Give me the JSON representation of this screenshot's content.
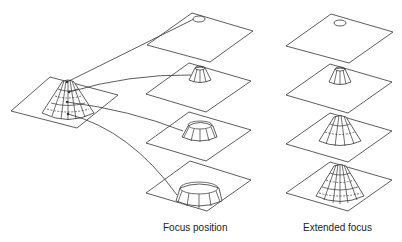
{
  "figure": {
    "colors": {
      "stroke": "#333333",
      "background": "#ffffff"
    }
  },
  "specimen": {
    "label": "cone-specimen",
    "shape": "cone"
  },
  "columns": [
    {
      "id": "focus-position",
      "caption": "Focus position",
      "slices": [
        "top-circle",
        "small-truncated-cone",
        "medium-ring",
        "large-ring"
      ]
    },
    {
      "id": "extended-focus",
      "caption": "Extended focus",
      "slices": [
        "top-circle",
        "small-truncated-cone",
        "medium-cone",
        "full-cone"
      ]
    }
  ]
}
